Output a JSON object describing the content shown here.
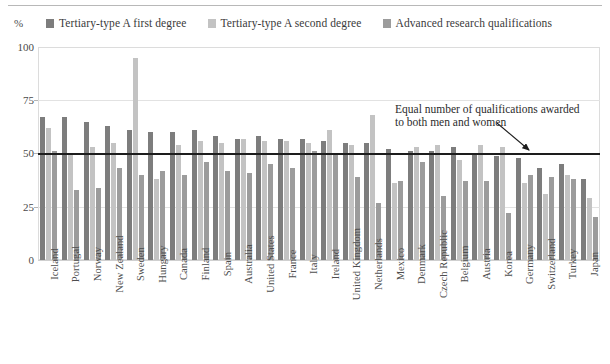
{
  "chart_data": {
    "type": "bar",
    "title": "",
    "subtitle": "",
    "xlabel": "",
    "ylabel": "%",
    "ylim": [
      0,
      100
    ],
    "yticks": [
      0,
      25,
      50,
      75,
      100
    ],
    "ytick_labels": [
      "0",
      "25",
      "50",
      "75",
      "100"
    ],
    "grid": true,
    "legend_position": "top",
    "annotations": [
      {
        "name": "parity-line-annotation",
        "line1": "Equal number of qualifications awarded",
        "line2": "to both men and women",
        "points_to": "50% reference line"
      }
    ],
    "reference_lines": [
      {
        "name": "parity-line",
        "value": 50,
        "color": "#1d1d1d"
      }
    ],
    "categories": [
      "Iceland",
      "Portugal",
      "Norway",
      "New Zealand",
      "Sweden",
      "Hungary",
      "Canada",
      "Finland",
      "Spain",
      "Australia",
      "United States",
      "France",
      "Italy",
      "Ireland",
      "United Kingdom",
      "Netherlands",
      "Mexico",
      "Denmark",
      "Czech Republic",
      "Belgium",
      "Austria",
      "Korea",
      "Germany",
      "Switzerland",
      "Turkey",
      "Japan"
    ],
    "series": [
      {
        "name": "Tertiary-type A first degree",
        "color": "#7d7d7d",
        "values": [
          67,
          67,
          65,
          63,
          61,
          60,
          60,
          61,
          58,
          57,
          58,
          57,
          57,
          56,
          55,
          55,
          52,
          51,
          51,
          53,
          50,
          49,
          48,
          43,
          45,
          38
        ]
      },
      {
        "name": "Tertiary-type A second degree",
        "color": "#c3c3c3",
        "values": [
          62,
          50,
          53,
          55,
          95,
          38,
          54,
          56,
          55,
          57,
          56,
          56,
          55,
          61,
          54,
          68,
          36,
          53,
          54,
          47,
          54,
          53,
          36,
          31,
          40,
          29
        ]
      },
      {
        "name": "Advanced research qualifications",
        "color": "#9c9c9c",
        "values": [
          51,
          33,
          34,
          43,
          40,
          42,
          40,
          46,
          42,
          41,
          45,
          43,
          51,
          50,
          39,
          27,
          37,
          46,
          30,
          37,
          37,
          22,
          40,
          39,
          38,
          20
        ]
      }
    ]
  },
  "legend": {
    "percent_symbol": "%",
    "items": [
      {
        "label": "Tertiary-type A first degree",
        "color": "#7d7d7d",
        "icon": "square-swatch-icon"
      },
      {
        "label": "Tertiary-type A second degree",
        "color": "#c3c3c3",
        "icon": "square-swatch-icon"
      },
      {
        "label": "Advanced research qualifications",
        "color": "#9c9c9c",
        "icon": "square-swatch-icon"
      }
    ]
  }
}
